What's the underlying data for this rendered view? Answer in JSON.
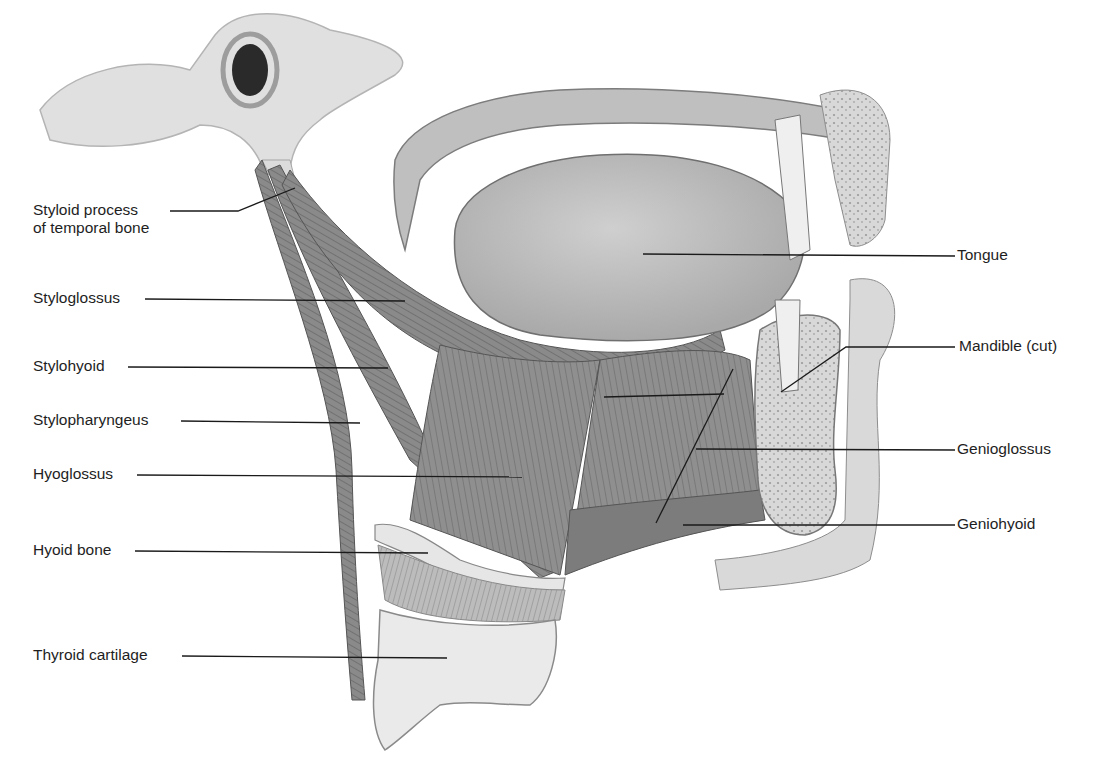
{
  "diagram": {
    "palette": {
      "background": "#ffffff",
      "muscle_dark": "#6e6e6e",
      "muscle_mid": "#8c8c8c",
      "muscle_light": "#a8a8a8",
      "bone": "#dedede",
      "bone_light": "#efefef",
      "tongue": "#b8b8b8",
      "text": "#1e1e1e",
      "leader": "#1a1a1a"
    },
    "labels_left": [
      {
        "id": "styloid-process",
        "text": "Styloid process\nof temporal bone",
        "x": 33,
        "y": 201
      },
      {
        "id": "styloglossus",
        "text": "Styloglossus",
        "x": 33,
        "y": 289
      },
      {
        "id": "stylohyoid",
        "text": "Stylohyoid",
        "x": 33,
        "y": 357
      },
      {
        "id": "stylopharyngeus",
        "text": "Stylopharyngeus",
        "x": 33,
        "y": 411
      },
      {
        "id": "hyoglossus",
        "text": "Hyoglossus",
        "x": 33,
        "y": 465
      },
      {
        "id": "hyoid-bone",
        "text": "Hyoid bone",
        "x": 33,
        "y": 541
      },
      {
        "id": "thyroid-cartilage",
        "text": "Thyroid cartilage",
        "x": 33,
        "y": 646
      }
    ],
    "labels_right": [
      {
        "id": "tongue",
        "text": "Tongue",
        "x": 957,
        "y": 246
      },
      {
        "id": "mandible",
        "text": "Mandible (cut)",
        "x": 959,
        "y": 337
      },
      {
        "id": "genioglossus",
        "text": "Genioglossus",
        "x": 957,
        "y": 440
      },
      {
        "id": "geniohyoid",
        "text": "Geniohyoid",
        "x": 957,
        "y": 515
      }
    ],
    "leaders": [
      {
        "for": "styloid-process",
        "points": "170,211 238,211 295,188"
      },
      {
        "for": "styloglossus",
        "points": "145,299 405,301"
      },
      {
        "for": "stylohyoid",
        "points": "128,367 388,368"
      },
      {
        "for": "stylopharyngeus",
        "points": "181,421 360,423"
      },
      {
        "for": "hyoglossus",
        "points": "137,475 522,477"
      },
      {
        "for": "hyoid-bone",
        "points": "135,551 428,553"
      },
      {
        "for": "thyroid-cartilage",
        "points": "182,656 447,658"
      },
      {
        "for": "tongue",
        "points": "955,256 643,254"
      },
      {
        "for": "mandible",
        "points": "955,347 846,347 781,392"
      },
      {
        "for": "genioglossus",
        "points": "955,450 696,449"
      },
      {
        "for": "geniohyoid",
        "points": "955,525 683,525"
      },
      {
        "for": "geniohyoid-inner",
        "points": "733,369 656,523"
      },
      {
        "for": "genioglossus-inner",
        "points": "604,397 724,394"
      }
    ]
  }
}
